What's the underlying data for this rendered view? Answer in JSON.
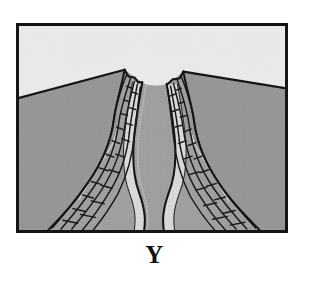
{
  "figure": {
    "caption": "Y",
    "frame": {
      "border_color": "#151515",
      "border_width_px": 3,
      "x": 16,
      "y": 23,
      "width": 272,
      "height": 210
    }
  },
  "palette": {
    "sky": "#e9e9e9",
    "sky_texture": "#dcdcdc",
    "land": "#9b9b9b",
    "land_texture": "#8d8d8d",
    "canyon_wall": "#a5a5a5",
    "canyon_wall_shadow": "#8a8a8a",
    "terrace_light": "#d8d8d8",
    "river": "#a0a0a0",
    "river_highlight": "#bfbfbf",
    "outline": "#151515",
    "hachure": "#1a1a1a",
    "caption_color": "#111111",
    "background": "#ffffff"
  },
  "scene": {
    "regions": [
      {
        "name": "sky",
        "label": "Sky / background above horizon",
        "fill": "#e9e9e9"
      },
      {
        "name": "plateau-left",
        "label": "Left upland plateau surface",
        "fill": "#9b9b9b"
      },
      {
        "name": "plateau-right",
        "label": "Right upland plateau surface",
        "fill": "#9b9b9b"
      },
      {
        "name": "canyon-wall-left",
        "label": "Left eroded canyon wall",
        "fill": "#a5a5a5"
      },
      {
        "name": "canyon-wall-right",
        "label": "Right eroded canyon wall",
        "fill": "#a5a5a5"
      },
      {
        "name": "terrace-left",
        "label": "Left light-toned terrace / bank deposit",
        "fill": "#d8d8d8"
      },
      {
        "name": "terrace-right",
        "label": "Right light-toned terrace / bank deposit",
        "fill": "#d8d8d8"
      },
      {
        "name": "river-channel",
        "label": "Meandering river channel on canyon floor",
        "fill": "#a0a0a0"
      },
      {
        "name": "canyon-notch",
        "label": "Canyon notch opening at the horizon",
        "fill": "#e9e9e9"
      }
    ],
    "horizon": {
      "label": "Horizon line separating sky from upland surface",
      "left_y": 70,
      "notch_left_x": 108,
      "notch_right_x": 168,
      "right_y": 62
    }
  },
  "geometry": {
    "sky_poly": "M0,0 L272,0 L272,66 L168,48 L150,82 L120,84 L108,46 L0,74 Z",
    "land_left_poly": "M0,74 L108,46 L108,210 L0,210 Z",
    "land_right_poly": "M168,48 L272,66 L272,210 L168,210 Z",
    "notch_poly": "M108,46 L120,84 L150,82 L168,48 Z",
    "wall_left_outer": "M104,48 C92,92 70,140 44,196 L40,210 L118,210 C126,160 122,104 126,56 Z",
    "wall_right_outer": "M170,50 C182,94 206,142 232,196 L236,210 L162,210 C154,158 160,104 156,58 Z",
    "river_left_bank": "M126,60 C116,96 110,132 124,168 C134,194 132,202 130,210",
    "river_right_bank": "M152,62 C160,96 166,130 152,164 C142,190 144,202 146,210",
    "terrace_left": "M126,60 C116,96 110,132 124,168 C134,194 132,202 130,210 L116,210 C118,198 120,190 112,168 C98,132 104,94 114,58 Z",
    "terrace_right": "M152,62 C160,96 166,130 152,164 C142,190 144,202 146,210 L162,210 C160,198 158,190 166,166 C180,130 172,94 164,60 Z",
    "river_body": "M126,60 C116,96 110,132 124,168 C134,194 132,202 130,210 L146,210 C144,202 142,190 152,164 C166,130 160,96 152,62 Z"
  },
  "hachures": {
    "label": "Erosion ridge / gully lines drawn on the canyon walls",
    "left_count": 5,
    "right_count": 5,
    "stroke": "#1a1a1a"
  }
}
